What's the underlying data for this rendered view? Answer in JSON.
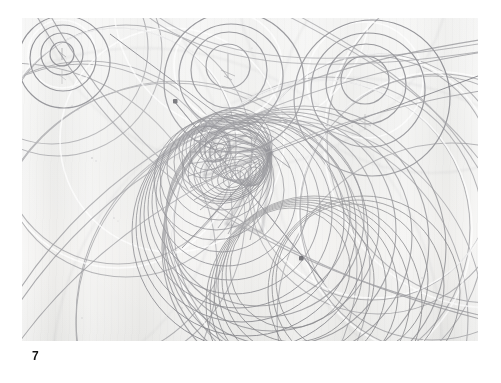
{
  "page": {
    "background_color": "#ffffff",
    "caption": "7",
    "caption_position": "bottom-left"
  },
  "plate": {
    "name": "compass-arc-pencil-drawing",
    "medium": "graphite pencil on textured paper",
    "paper_color": "#ecebe9",
    "line_color": "#8b8b8e",
    "dark_line_color": "#6e6e73",
    "accent_dot_color": "#5a5a5e",
    "bounds": {
      "x": 22,
      "y": 18,
      "width": 456,
      "height": 323
    },
    "description": "Overlapping compass-drawn circles and sweeping arcs forming a dense caustic envelope near the centre",
    "elements": {
      "concentric_clusters": [
        {
          "name": "cluster-upper-left",
          "cx": 40,
          "cy": 36,
          "radii": [
            12,
            21,
            33,
            46
          ],
          "pin_mark": true
        },
        {
          "name": "cluster-upper-middle",
          "cx": 206,
          "cy": 48,
          "radii": [
            22,
            38,
            52,
            70
          ],
          "pin_mark": true
        },
        {
          "name": "cluster-upper-right",
          "cx": 343,
          "cy": 62,
          "radii": [
            24,
            40,
            57,
            78
          ],
          "pin_mark": true
        }
      ],
      "pin_dots": [
        {
          "name": "pin-dot-upper",
          "x": 153,
          "y": 83
        },
        {
          "name": "pin-dot-lower",
          "x": 279,
          "y": 240
        }
      ],
      "envelope_node": {
        "name": "caustic-convergence-node",
        "x": 250,
        "y": 134
      },
      "caustic_band": {
        "name": "spirograph-envelope",
        "center": {
          "x": 215,
          "y": 150
        },
        "line_count": 26
      },
      "large_arc_count": 34
    }
  }
}
